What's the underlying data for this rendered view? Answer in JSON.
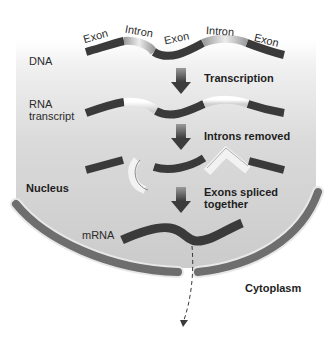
{
  "labels": {
    "dna": "DNA",
    "rna_transcript_line1": "RNA",
    "rna_transcript_line2": "transcript",
    "nucleus": "Nucleus",
    "mrna": "mRNA",
    "cytoplasm": "Cytoplasm"
  },
  "segments": [
    "Exon",
    "Intron",
    "Exon",
    "Intron",
    "Exon"
  ],
  "steps": [
    {
      "label": "Transcription"
    },
    {
      "label": "Introns removed"
    },
    {
      "label_line1": "Exons spliced",
      "label_line2": "together"
    }
  ],
  "colors": {
    "exon": "#3a3a3a",
    "intron_light": "#e8e8e8",
    "intron_dark": "#a8a8a8",
    "nucleus_fill": "#d2d2d2",
    "membrane": "#6e6e6e",
    "arrow": "#4a4a4a"
  }
}
